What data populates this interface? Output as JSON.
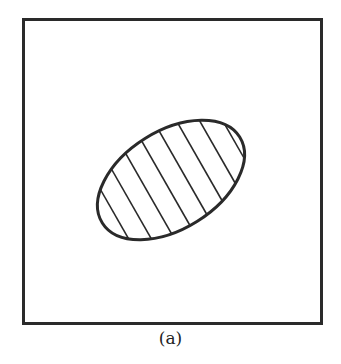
{
  "figure": {
    "caption": "(a)",
    "frame": {
      "x": 23,
      "y": 19,
      "width": 298,
      "height": 304,
      "stroke": "#2a2a2a"
    },
    "ellipse": {
      "cx": 171,
      "cy": 180,
      "rx": 82,
      "ry": 50,
      "rotation": -32,
      "stroke": "#2a2a2a",
      "fill": "hatched"
    },
    "hatch": {
      "angle_deg": 60,
      "line_count": 11,
      "color": "#2a2a2a"
    }
  }
}
